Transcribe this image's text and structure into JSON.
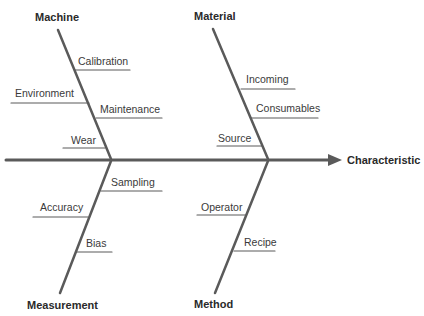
{
  "diagram": {
    "type": "fishbone",
    "effect": "Characteristic",
    "categories": {
      "machine": {
        "label": "Machine",
        "causes": [
          "Calibration",
          "Environment",
          "Maintenance",
          "Wear"
        ]
      },
      "material": {
        "label": "Material",
        "causes": [
          "Incoming",
          "Consumables",
          "Source"
        ]
      },
      "measurement": {
        "label": "Measurement",
        "causes": [
          "Sampling",
          "Accuracy",
          "Bias"
        ]
      },
      "method": {
        "label": "Method",
        "causes": [
          "Operator",
          "Recipe"
        ]
      }
    },
    "colors": {
      "line": "#5a5a5a",
      "text": "#3a3a3a"
    }
  }
}
